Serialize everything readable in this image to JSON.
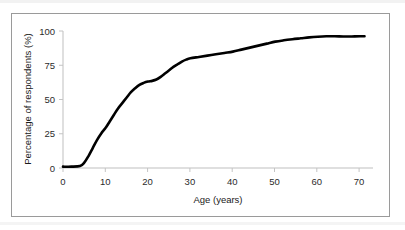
{
  "figure": {
    "background_color": "#ffffff",
    "frame_color": "#9a9a9a",
    "axis_color": "#bfbfbf",
    "line_color": "#000000"
  },
  "chart_data": {
    "type": "line",
    "title": "",
    "subtitle": "",
    "xlabel": "Age (years)",
    "ylabel": "Percentage of respondents (%)",
    "xlim": [
      0,
      73
    ],
    "ylim": [
      0,
      103
    ],
    "grid": false,
    "legend": false,
    "legend_position": "none",
    "xticks": [
      0,
      10,
      20,
      30,
      40,
      50,
      60,
      70
    ],
    "xtick_labels": [
      "0",
      "10",
      "20",
      "30",
      "40",
      "50",
      "60",
      "70"
    ],
    "yticks": [
      0,
      25,
      50,
      75,
      100
    ],
    "ytick_labels": [
      "0",
      "25",
      "50",
      "75",
      "100"
    ],
    "series": [
      {
        "name": "Cumulative percentage of respondents by age",
        "x": [
          0,
          2,
          4,
          5,
          6,
          7,
          8,
          9,
          10,
          11,
          12,
          13,
          14,
          15,
          16,
          17,
          18,
          19,
          20,
          21,
          22,
          23,
          24,
          25,
          26,
          27,
          28,
          29,
          30,
          32,
          34,
          36,
          38,
          40,
          42,
          44,
          46,
          48,
          50,
          52,
          54,
          56,
          58,
          60,
          62,
          64,
          66,
          68,
          70,
          71
        ],
        "y": [
          1,
          1,
          1.5,
          4,
          9,
          15,
          21,
          26,
          30,
          35,
          40,
          45,
          49,
          53,
          57,
          60,
          62.5,
          64,
          65,
          65.5,
          66.5,
          68.5,
          71,
          73.5,
          76,
          78,
          80,
          81.5,
          82.5,
          83.5,
          84.5,
          85.5,
          86.5,
          87.5,
          89,
          90.5,
          92,
          93.5,
          95,
          96,
          96.8,
          97.5,
          98.2,
          98.7,
          99,
          99,
          98.9,
          98.9,
          99,
          99
        ]
      }
    ]
  }
}
